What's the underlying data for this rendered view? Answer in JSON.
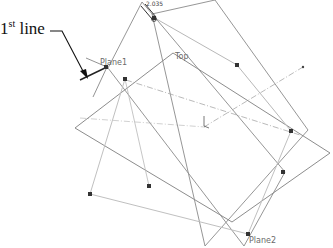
{
  "viewport": {
    "width": 333,
    "height": 248
  },
  "annotation": {
    "label_main": "1",
    "label_sup": "st",
    "label_rest": " line"
  },
  "dimension": {
    "value": "2.035"
  },
  "planes": {
    "plane1": {
      "label": "Plane1"
    },
    "top": {
      "label": "Top"
    },
    "plane2": {
      "label": "Plane2"
    }
  },
  "colors": {
    "plane_edge": "#7a7a7a",
    "plane_edge_light": "#b5b5b5",
    "axis_dash": "#a8a8a8",
    "handle": "#333333",
    "sketch_line": "#222222",
    "arrow": "#111111"
  },
  "geometry": {
    "top_plane": [
      [
        75,
        128
      ],
      [
        173,
        53
      ],
      [
        330,
        153
      ],
      [
        232,
        222
      ]
    ],
    "plane1_rect": [
      [
        108,
        68
      ],
      [
        142,
        2
      ],
      [
        285,
        172
      ],
      [
        244,
        245
      ]
    ],
    "plane2_rect": [
      [
        152,
        12
      ],
      [
        215,
        0
      ],
      [
        300,
        130
      ],
      [
        205,
        245
      ]
    ],
    "handles": [
      [
        106,
        67
      ],
      [
        125,
        79
      ],
      [
        237,
        65
      ],
      [
        291,
        131
      ],
      [
        90,
        194
      ],
      [
        149,
        186
      ],
      [
        283,
        172
      ],
      [
        248,
        234
      ],
      [
        153,
        17
      ]
    ],
    "axis_lines": [
      [
        [
          126,
          80
        ],
        [
          305,
          135
        ]
      ],
      [
        [
          205,
          130
        ],
        [
          302,
          68
        ]
      ],
      [
        [
          78,
          111
        ],
        [
          125,
          79
        ]
      ]
    ],
    "sketch_line": [
      [
        80,
        135
      ],
      [
        107,
        67
      ]
    ]
  }
}
